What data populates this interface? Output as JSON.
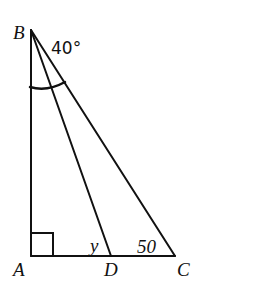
{
  "diagram": {
    "type": "right-triangle-geometry",
    "points": {
      "A": {
        "label": "A",
        "x": 31,
        "y": 256
      },
      "B": {
        "label": "B",
        "x": 31,
        "y": 30
      },
      "C": {
        "label": "C",
        "x": 175,
        "y": 256
      },
      "D": {
        "label": "D",
        "x": 111,
        "y": 256
      }
    },
    "segments": [
      "AB",
      "AC",
      "BC",
      "BD"
    ],
    "right_angle_at": "A",
    "annotations": {
      "angle_B": "40°",
      "angle_D": "y",
      "angle_C": "50"
    },
    "colors": {
      "stroke": "#111111",
      "background": "#ffffff"
    }
  }
}
